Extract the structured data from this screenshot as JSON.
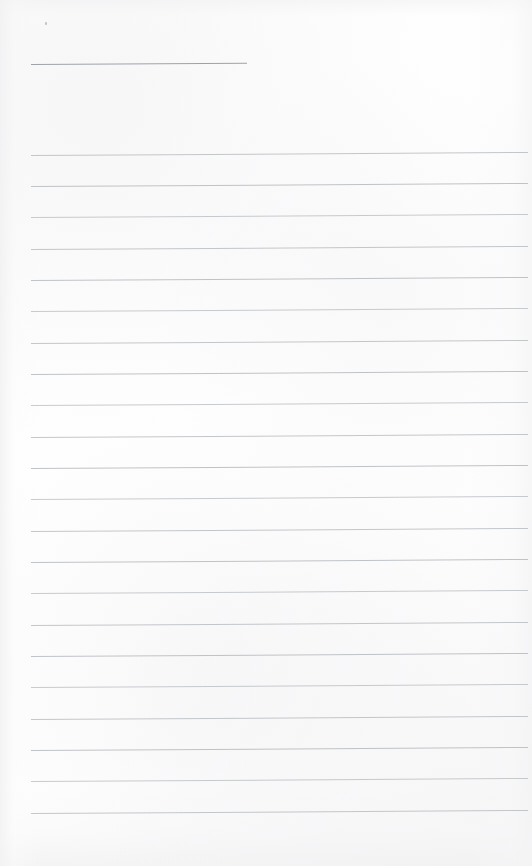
{
  "document": {
    "type": "scanned-lined-notebook-page",
    "title": "Blank Lined Notebook Page",
    "page_width": 532,
    "page_height": 866,
    "paper_color": "#fefefe",
    "rule_color": "#b9bcc0",
    "title_rule_color": "#9ea2a7",
    "content_text": "",
    "handwriting_text": "",
    "page_number": ""
  },
  "layout": {
    "left_margin": 31,
    "right_edge": 528,
    "line_spacing": 31.3,
    "rule_tilt_degrees": -0.35,
    "ruled_line_count": 22,
    "first_ruled_line_y": 155,
    "last_ruled_line_y": 813
  },
  "title_rule": {
    "label": "title-underline",
    "x": 31,
    "y": 64,
    "width": 216
  },
  "ruled_lines": [
    {
      "index": 1,
      "y": 155,
      "x": 31,
      "width": 497
    },
    {
      "index": 2,
      "y": 186,
      "x": 31,
      "width": 497
    },
    {
      "index": 3,
      "y": 217,
      "x": 31,
      "width": 497
    },
    {
      "index": 4,
      "y": 249,
      "x": 31,
      "width": 497
    },
    {
      "index": 5,
      "y": 280,
      "x": 31,
      "width": 497
    },
    {
      "index": 6,
      "y": 311,
      "x": 31,
      "width": 497
    },
    {
      "index": 7,
      "y": 343,
      "x": 31,
      "width": 497
    },
    {
      "index": 8,
      "y": 374,
      "x": 31,
      "width": 497
    },
    {
      "index": 9,
      "y": 405,
      "x": 31,
      "width": 497
    },
    {
      "index": 10,
      "y": 437,
      "x": 31,
      "width": 497
    },
    {
      "index": 11,
      "y": 468,
      "x": 31,
      "width": 497
    },
    {
      "index": 12,
      "y": 499,
      "x": 31,
      "width": 497
    },
    {
      "index": 13,
      "y": 531,
      "x": 31,
      "width": 497
    },
    {
      "index": 14,
      "y": 562,
      "x": 31,
      "width": 497
    },
    {
      "index": 15,
      "y": 593,
      "x": 31,
      "width": 497
    },
    {
      "index": 16,
      "y": 625,
      "x": 31,
      "width": 497
    },
    {
      "index": 17,
      "y": 656,
      "x": 31,
      "width": 497
    },
    {
      "index": 18,
      "y": 687,
      "x": 31,
      "width": 497
    },
    {
      "index": 19,
      "y": 719,
      "x": 31,
      "width": 497
    },
    {
      "index": 20,
      "y": 750,
      "x": 31,
      "width": 497
    },
    {
      "index": 21,
      "y": 781,
      "x": 31,
      "width": 497
    },
    {
      "index": 22,
      "y": 813,
      "x": 31,
      "width": 497
    }
  ],
  "artifacts": [
    {
      "label": "scan-speck",
      "x": 45,
      "y": 22,
      "width": 2,
      "height": 3
    }
  ]
}
